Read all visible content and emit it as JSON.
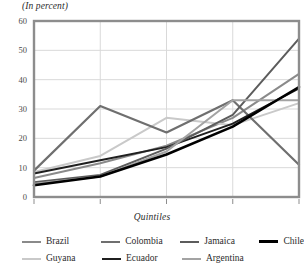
{
  "header": {
    "unit_note": "(In percent)"
  },
  "axis": {
    "x_title": "Quintiles",
    "x_ticks": [
      "1",
      "2",
      "3",
      "4",
      "5"
    ],
    "y_ticks": [
      "0",
      "10",
      "20",
      "30",
      "40",
      "50",
      "60"
    ]
  },
  "colors": {
    "frame": "#8d8d8d",
    "gridline": "#d9d9d9",
    "brazil": "#8a8a8a",
    "guyana": "#c9c9c9",
    "colombia": "#6f6f6f",
    "ecuador": "#1f1f1f",
    "jamaica": "#5c5c5c",
    "argentina": "#a3a3a3",
    "chile": "#000000"
  },
  "chart_data": {
    "type": "line",
    "title": "",
    "subtitle": "",
    "xlabel": "Quintiles",
    "ylabel": "",
    "unit": "In percent",
    "x": [
      1,
      2,
      3,
      4,
      5
    ],
    "xlim": [
      1,
      5
    ],
    "ylim": [
      0,
      60
    ],
    "yticks": [
      0,
      10,
      20,
      30,
      40,
      50,
      60
    ],
    "grid": true,
    "legend_position": "bottom",
    "series": [
      {
        "name": "Brazil",
        "color": "#8a8a8a",
        "width": 2.0,
        "values": [
          6.5,
          11.5,
          17.5,
          27.0,
          42.0
        ]
      },
      {
        "name": "Guyana",
        "color": "#c9c9c9",
        "width": 2.0,
        "values": [
          8.5,
          14.0,
          27.0,
          24.5,
          32.0
        ]
      },
      {
        "name": "Colombia",
        "color": "#6f6f6f",
        "width": 2.2,
        "values": [
          9.0,
          31.0,
          22.0,
          33.0,
          11.0
        ]
      },
      {
        "name": "Ecuador",
        "color": "#1f1f1f",
        "width": 2.0,
        "values": [
          8.0,
          12.5,
          17.0,
          25.0,
          37.0
        ]
      },
      {
        "name": "Jamaica",
        "color": "#5c5c5c",
        "width": 2.0,
        "values": [
          5.0,
          7.5,
          16.5,
          28.0,
          54.0
        ]
      },
      {
        "name": "Argentina",
        "color": "#a3a3a3",
        "width": 2.0,
        "values": [
          4.5,
          7.0,
          15.5,
          33.0,
          33.0
        ]
      },
      {
        "name": "Chile",
        "color": "#000000",
        "width": 2.6,
        "values": [
          4.0,
          7.0,
          14.5,
          24.0,
          37.5
        ]
      }
    ]
  },
  "legend": {
    "rows": [
      [
        {
          "label": "Brazil",
          "color": "#8a8a8a",
          "width": 2.0
        },
        {
          "label": "Colombia",
          "color": "#6f6f6f",
          "width": 2.2
        },
        {
          "label": "Jamaica",
          "color": "#5c5c5c",
          "width": 2.0
        },
        {
          "label": "Chile",
          "color": "#000000",
          "width": 3.0
        }
      ],
      [
        {
          "label": "Guyana",
          "color": "#c9c9c9",
          "width": 2.0
        },
        {
          "label": "Ecuador",
          "color": "#1f1f1f",
          "width": 2.6
        },
        {
          "label": "Argentina",
          "color": "#a3a3a3",
          "width": 2.0
        }
      ]
    ]
  }
}
